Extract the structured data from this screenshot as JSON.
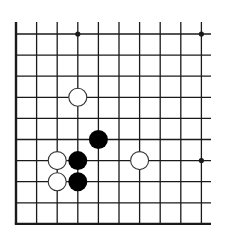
{
  "board": {
    "description": "Go board fragment (lower-left corner, top and right sides cut off)",
    "columns_visible": 10,
    "rows_visible": 10,
    "colors": {
      "background": "#ffffff",
      "line": "#1a1a1a",
      "black_stone": "#000000",
      "white_stone_fill": "#ffffff",
      "white_stone_stroke": "#333333"
    },
    "geometry": {
      "x0": 16,
      "y0": 34,
      "dx": 20.6,
      "dy": 21.1,
      "line_top_extent": 22,
      "line_right_extent": 211,
      "stone_radius": 9.5,
      "star_radius": 2.6
    },
    "star_points": [
      {
        "col": 3,
        "row": 0
      },
      {
        "col": 9,
        "row": 0
      },
      {
        "col": 9,
        "row": 6
      }
    ],
    "stones": [
      {
        "color": "white",
        "col": 3,
        "row": 3
      },
      {
        "color": "black",
        "col": 4,
        "row": 5
      },
      {
        "color": "white",
        "col": 2,
        "row": 6
      },
      {
        "color": "black",
        "col": 3,
        "row": 6
      },
      {
        "color": "white",
        "col": 6,
        "row": 6
      },
      {
        "color": "white",
        "col": 2,
        "row": 7
      },
      {
        "color": "black",
        "col": 3,
        "row": 7
      }
    ]
  }
}
